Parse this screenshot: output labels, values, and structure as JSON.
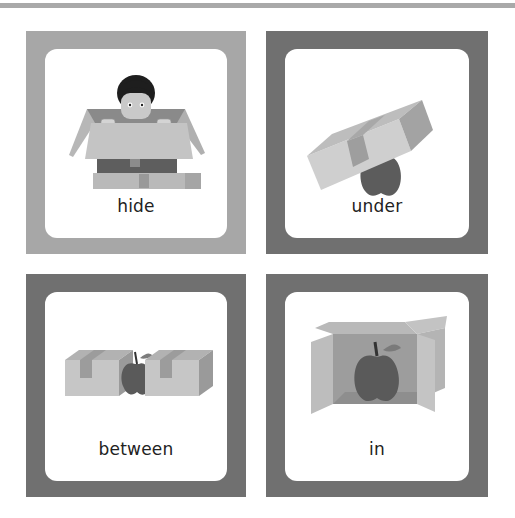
{
  "top_bar": {
    "color": "#a9a9a9"
  },
  "cards": [
    {
      "label": "hide",
      "frame_color": "#a7a7a7",
      "illustration": "boy-hiding-in-box"
    },
    {
      "label": "under",
      "frame_color": "#707070",
      "illustration": "apple-under-box"
    },
    {
      "label": "between",
      "frame_color": "#707070",
      "illustration": "apple-between-boxes"
    },
    {
      "label": "in",
      "frame_color": "#707070",
      "illustration": "apple-in-box"
    }
  ]
}
